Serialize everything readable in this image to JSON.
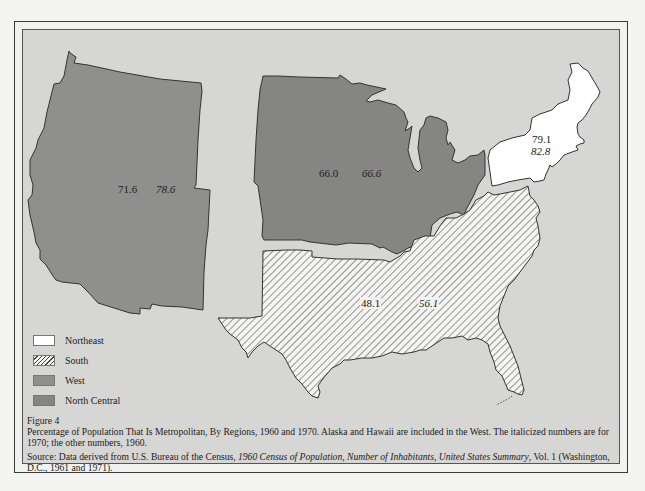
{
  "figure": {
    "number_label": "Figure 4",
    "caption": "Percentage of Population That Is Metropolitan, By Regions, 1960 and 1970.  Alaska and Hawaii are included in the West.  The italicized numbers are for 1970; the other numbers, 1960.",
    "source": {
      "prefix": "Source:  Data derived from U.S. Bureau of the Census, ",
      "title1": "1960 Census of Population",
      "sep1": ", ",
      "title2": "Number of Inhabitants",
      "sep2": ", ",
      "title3": "United States Summary",
      "suffix": ", Vol. 1 (Washington, D.C., 1961 and 1971)."
    }
  },
  "regions": {
    "west": {
      "name": "West",
      "v1960": "71.6",
      "v1970": "78.6",
      "fill": "#8f8f8d"
    },
    "north_central": {
      "name": "North Central",
      "v1960": "66.0",
      "v1970": "66.6",
      "fill": "#858583"
    },
    "northeast": {
      "name": "Northeast",
      "v1960": "79.1",
      "v1970": "82.8",
      "fill": "#ffffff"
    },
    "south": {
      "name": "South",
      "v1960": "48.1",
      "v1970": "56.1",
      "fill": "hatched"
    }
  },
  "legend": [
    {
      "label": "Northeast",
      "style": "white"
    },
    {
      "label": "South",
      "style": "hatched"
    },
    {
      "label": "West",
      "style": "gray"
    },
    {
      "label": "North Central",
      "style": "dark-gray"
    }
  ],
  "colors": {
    "background": "#d6d6d4",
    "outline": "#333333",
    "west": "#8f8f8d",
    "north_central": "#858583",
    "northeast": "#ffffff"
  }
}
